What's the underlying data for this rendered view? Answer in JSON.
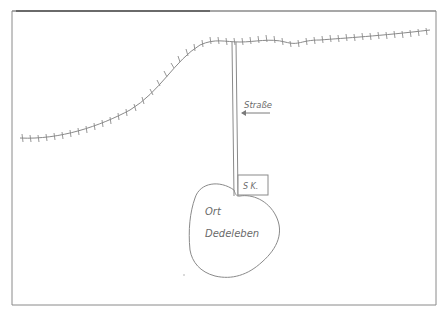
{
  "diagram": {
    "type": "hand-drawn sketch map",
    "colors": {
      "frame": "#7a7a7a",
      "ink": "#8a8a8a",
      "text": "#6a6a6a",
      "background": "#ffffff"
    },
    "labels": {
      "road": "Straße",
      "sign": "S K.",
      "place_line1": "Ort",
      "place_line2": "Dedeleben"
    },
    "elements": [
      {
        "id": "railway-line",
        "kind": "hatched line",
        "description": "railway track crossing the top of the map"
      },
      {
        "id": "road",
        "kind": "double line",
        "description": "road running from railway down to the village"
      },
      {
        "id": "road-arrow",
        "kind": "arrow",
        "points_to": "road"
      },
      {
        "id": "sign-box",
        "kind": "rectangle",
        "description": "sign on road at village edge"
      },
      {
        "id": "village-outline",
        "kind": "closed blob",
        "description": "village boundary"
      }
    ]
  }
}
